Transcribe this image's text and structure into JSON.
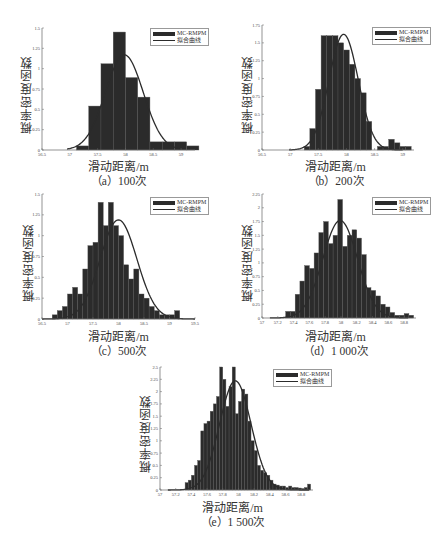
{
  "legend": {
    "hist_label": "MC-RMPM",
    "fit_label": "拟合曲线"
  },
  "colors": {
    "bar": "#2b2b2b",
    "bar_edge": "#555555",
    "curve": "#2b2b2b",
    "axis": "#666666"
  },
  "chart_data": [
    {
      "id": "a",
      "type": "bar",
      "title": "",
      "xlabel": "滑动距离/m",
      "ylabel": "概率密度函数",
      "caption": "（a）100次",
      "xlim": [
        56.5,
        59.25
      ],
      "ylim": [
        0,
        1.5
      ],
      "xticks": [
        56.5,
        57,
        57.5,
        58,
        58.5,
        59
      ],
      "xtick_labels": [
        "56.5",
        "57",
        "57.5",
        "58",
        "58.5",
        "59"
      ],
      "yticks": [
        0,
        0.25,
        0.5,
        0.75,
        1,
        1.25,
        1.5
      ],
      "ytick_labels": [
        "0",
        "0.25",
        "0.5",
        "0.75",
        "1",
        "1.25",
        "1.5"
      ],
      "bin_edges": [
        57.12,
        57.34,
        57.56,
        57.78,
        58.0,
        58.22,
        58.44,
        58.66,
        58.88,
        59.1,
        59.32
      ],
      "values": [
        0.05,
        0.54,
        1.06,
        1.45,
        0.89,
        0.65,
        0.1,
        0.1,
        0.1,
        0.05
      ],
      "fit": {
        "mean": 57.98,
        "peak": 1.17,
        "sigma": 0.34,
        "x_from": 56.95,
        "x_to": 59.0
      }
    },
    {
      "id": "b",
      "type": "bar",
      "title": "",
      "xlabel": "滑动距离/m",
      "ylabel": "概率密度函数",
      "caption": "（b）200次",
      "xlim": [
        56.5,
        59.2
      ],
      "ylim": [
        0,
        1.75
      ],
      "xticks": [
        56.5,
        57,
        57.5,
        58,
        58.5,
        59
      ],
      "xtick_labels": [
        "56.5",
        "57",
        "57.5",
        "58",
        "58.5",
        "59"
      ],
      "yticks": [
        0,
        0.25,
        0.5,
        0.75,
        1,
        1.25,
        1.5,
        1.75
      ],
      "ytick_labels": [
        "0",
        "0.25",
        "0.5",
        "0.75",
        "1",
        "1.25",
        "1.5",
        "1.75"
      ],
      "bin_edges": [
        57.25,
        57.35,
        57.45,
        57.55,
        57.65,
        57.75,
        57.85,
        57.95,
        58.05,
        58.15,
        58.25,
        58.35,
        58.45,
        58.55,
        58.65,
        58.75,
        58.85,
        58.95,
        59.05,
        59.15
      ],
      "values": [
        0.05,
        0.3,
        0.85,
        1.6,
        1.6,
        1.6,
        1.5,
        1.4,
        1.2,
        1.0,
        0.8,
        0.4,
        0.0,
        0.05,
        0.05,
        0.15,
        0.1,
        0.05,
        0.05
      ],
      "fit": {
        "mean": 57.95,
        "peak": 1.62,
        "sigma": 0.26,
        "x_from": 56.98,
        "x_to": 59.0
      }
    },
    {
      "id": "c",
      "type": "bar",
      "title": "",
      "xlabel": "滑动距离/m",
      "ylabel": "概率密度函数",
      "caption": "（c）500次",
      "xlim": [
        56.5,
        59.5
      ],
      "ylim": [
        0,
        1.5
      ],
      "xticks": [
        56.5,
        57,
        57.5,
        58,
        58.5,
        59,
        59.5
      ],
      "xtick_labels": [
        "56.5",
        "57",
        "57.5",
        "58",
        "58.5",
        "59",
        "59.5"
      ],
      "yticks": [
        0,
        0.25,
        0.5,
        0.75,
        1,
        1.25,
        1.5
      ],
      "ytick_labels": [
        "0",
        "0.25",
        "0.5",
        "0.75",
        "1",
        "1.25",
        "1.5"
      ],
      "bin_edges": [
        56.7,
        56.8,
        56.9,
        57.0,
        57.1,
        57.2,
        57.3,
        57.4,
        57.5,
        57.6,
        57.7,
        57.8,
        57.9,
        58.0,
        58.1,
        58.2,
        58.3,
        58.4,
        58.5,
        58.6,
        58.7,
        58.8,
        58.9,
        59.0,
        59.1,
        59.2,
        59.3,
        59.4
      ],
      "values": [
        0.05,
        0.1,
        0.15,
        0.3,
        0.38,
        0.3,
        0.6,
        0.88,
        0.92,
        1.4,
        1.12,
        1.4,
        1.12,
        1.0,
        0.65,
        0.48,
        0.6,
        0.3,
        0.25,
        0.15,
        0.1,
        0.05,
        0.05,
        0.05,
        0.1,
        0.0,
        0.0
      ],
      "fit": {
        "mean": 58.0,
        "peak": 1.19,
        "sigma": 0.36,
        "x_from": 56.5,
        "x_to": 59.5
      }
    },
    {
      "id": "d",
      "type": "bar",
      "title": "",
      "xlabel": "滑动距离/m",
      "ylabel": "概率密度函数",
      "caption": "（d）1 000次",
      "xlim": [
        57,
        58.95
      ],
      "ylim": [
        0,
        2.25
      ],
      "xticks": [
        57,
        57.2,
        57.4,
        57.6,
        57.8,
        58,
        58.2,
        58.4,
        58.6,
        58.8
      ],
      "xtick_labels": [
        "57",
        "57.2",
        "57.4",
        "57.6",
        "57.8",
        "58",
        "58.2",
        "58.4",
        "58.6",
        "58.8"
      ],
      "yticks": [
        0,
        0.25,
        0.5,
        0.75,
        1,
        1.25,
        1.5,
        1.75,
        2,
        2.25
      ],
      "ytick_labels": [
        "0",
        "0.25",
        "0.5",
        "0.75",
        "1",
        "1.25",
        "1.5",
        "1.75",
        "2",
        "2.25"
      ],
      "bin_edges": [
        57.3,
        57.36,
        57.42,
        57.48,
        57.54,
        57.6,
        57.66,
        57.72,
        57.78,
        57.84,
        57.9,
        57.96,
        58.02,
        58.08,
        58.14,
        58.2,
        58.26,
        58.32,
        58.38,
        58.44,
        58.5,
        58.56,
        58.62,
        58.68,
        58.74,
        58.8,
        58.86,
        58.92
      ],
      "values": [
        0.12,
        0.12,
        0.43,
        0.67,
        0.95,
        0.9,
        1.18,
        1.55,
        1.75,
        1.35,
        1.5,
        2.15,
        1.3,
        1.5,
        1.6,
        1.45,
        1.15,
        0.55,
        0.5,
        0.4,
        0.25,
        0.2,
        0.1,
        0.05,
        0.05,
        0.08,
        0.05
      ],
      "fit": {
        "mean": 57.99,
        "peak": 1.77,
        "sigma": 0.22,
        "x_from": 57.1,
        "x_to": 58.85
      }
    },
    {
      "id": "e",
      "type": "bar",
      "title": "",
      "xlabel": "滑动距离/m",
      "ylabel": "概率密度函数",
      "caption": "（e）1 500次",
      "xlim": [
        57,
        58.95
      ],
      "ylim": [
        0,
        2.5
      ],
      "xticks": [
        57,
        57.2,
        57.4,
        57.6,
        57.8,
        58,
        58.2,
        58.4,
        58.6,
        58.8
      ],
      "xtick_labels": [
        "57",
        "57.2",
        "57.4",
        "57.6",
        "57.8",
        "58",
        "58.2",
        "58.4",
        "58.6",
        "58.8"
      ],
      "yticks": [
        0,
        0.25,
        0.5,
        0.75,
        1,
        1.25,
        1.5,
        1.75,
        2,
        2.25,
        2.5
      ],
      "ytick_labels": [
        "0",
        "0.25",
        "0.5",
        "0.75",
        "1",
        "1.25",
        "1.5",
        "1.75",
        "2",
        "2.25",
        "2.5"
      ],
      "bin_edges": [
        57.32,
        57.36,
        57.4,
        57.44,
        57.48,
        57.52,
        57.56,
        57.6,
        57.64,
        57.68,
        57.72,
        57.76,
        57.8,
        57.84,
        57.88,
        57.92,
        57.96,
        58.0,
        58.04,
        58.08,
        58.12,
        58.16,
        58.2,
        58.24,
        58.28,
        58.32,
        58.36,
        58.4,
        58.44,
        58.48,
        58.52,
        58.56,
        58.6,
        58.64,
        58.68,
        58.72,
        58.76,
        58.8,
        58.84,
        58.88,
        58.92
      ],
      "values": [
        0.15,
        0.2,
        0.3,
        0.5,
        0.6,
        1.2,
        1.35,
        1.4,
        1.6,
        1.75,
        1.9,
        2.5,
        2.25,
        1.7,
        2.1,
        2.5,
        1.55,
        1.8,
        2.05,
        1.95,
        1.4,
        1.0,
        0.8,
        0.5,
        0.4,
        0.35,
        0.3,
        0.2,
        0.12,
        0.1,
        0.08,
        0.08,
        0.05,
        0.08,
        0.05,
        0.05,
        0.04,
        0.03,
        0.05,
        0.12
      ],
      "fit": {
        "mean": 57.96,
        "peak": 2.22,
        "sigma": 0.2,
        "x_from": 57.1,
        "x_to": 58.9
      }
    }
  ]
}
